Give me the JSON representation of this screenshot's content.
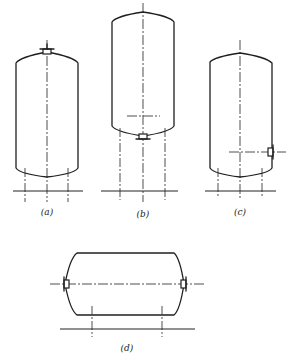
{
  "figure": {
    "type": "vessel-nozzle-arrangement-diagram",
    "panels": [
      {
        "id": "a",
        "label": "(a)",
        "orientation": "vertical",
        "nozzle_position": "top-head"
      },
      {
        "id": "b",
        "label": "(b)",
        "orientation": "vertical",
        "nozzle_position": "bottom-head"
      },
      {
        "id": "c",
        "label": "(c)",
        "orientation": "vertical",
        "nozzle_position": "side-shell-lower"
      },
      {
        "id": "d",
        "label": "(d)",
        "orientation": "horizontal",
        "nozzle_position": "both-heads"
      }
    ],
    "colors": {
      "line": "#1f1f1f",
      "background": "#ffffff"
    }
  }
}
